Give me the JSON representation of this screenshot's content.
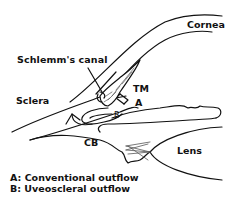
{
  "diagram": {
    "labels": {
      "schlemms_canal": "Schlemm's canal",
      "cornea": "Cornea",
      "sclera": "Sclera",
      "tm": "TM",
      "a": "A",
      "b": "B",
      "cb": "CB",
      "lens": "Lens"
    },
    "legend": [
      {
        "key": "A",
        "text": "A: Conventional outflow"
      },
      {
        "key": "B",
        "text": "B: Uveoscleral outflow"
      }
    ],
    "colors": {
      "line": "#111111",
      "background": "#ffffff",
      "hatch": "#555555"
    }
  }
}
